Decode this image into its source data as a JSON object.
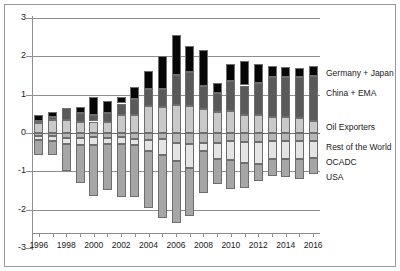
{
  "chart_data": {
    "type": "bar",
    "subtype": "stacked-bar-diverging",
    "title": "",
    "xlabel": "",
    "ylabel": "",
    "ylim": [
      -3,
      3
    ],
    "yticks": [
      3,
      2,
      1,
      0,
      -1,
      -2,
      -3
    ],
    "ytick_labels": [
      "3",
      "2",
      "1",
      "0",
      "-1",
      "-2",
      "-3"
    ],
    "grid": true,
    "legend_position": "right",
    "categories": [
      "1996",
      "1997",
      "1998",
      "1999",
      "2000",
      "2001",
      "2002",
      "2003",
      "2004",
      "2005",
      "2006",
      "2007",
      "2008",
      "2009",
      "2010",
      "2011",
      "2012",
      "2013",
      "2014",
      "2015",
      "2016"
    ],
    "xtick_labels": [
      "1996",
      "1998",
      "2000",
      "2002",
      "2004",
      "2006",
      "2008",
      "2010",
      "2012",
      "2014",
      "2016"
    ],
    "series": [
      {
        "name": "Germany + Japan",
        "color": "#c9c9c9",
        "values": [
          0.25,
          0.33,
          0.34,
          0.3,
          0.3,
          0.28,
          0.46,
          0.48,
          0.7,
          0.67,
          0.73,
          0.71,
          0.62,
          0.56,
          0.58,
          0.46,
          0.47,
          0.43,
          0.41,
          0.39,
          0.31
        ]
      },
      {
        "name": "China + EMA",
        "color": "#5a5a5a",
        "values": [
          0.07,
          0.09,
          0.31,
          0.22,
          0.17,
          0.23,
          0.31,
          0.42,
          0.45,
          0.47,
          0.78,
          0.88,
          0.62,
          0.49,
          0.77,
          0.78,
          0.83,
          1.03,
          1.06,
          1.07,
          1.19
        ]
      },
      {
        "name": "Oil Exporters",
        "color": "#060606",
        "values": [
          0.14,
          0.13,
          0.0,
          0.15,
          0.46,
          0.33,
          0.17,
          0.3,
          0.46,
          0.86,
          1.04,
          0.69,
          0.92,
          0.26,
          0.46,
          0.64,
          0.49,
          0.28,
          0.26,
          0.25,
          0.24
        ]
      },
      {
        "name": "Rest of the World",
        "color": "#b6b6b6",
        "values": [
          -0.08,
          -0.09,
          -0.12,
          -0.13,
          -0.11,
          -0.12,
          -0.1,
          -0.15,
          -0.19,
          -0.15,
          -0.27,
          -0.29,
          -0.27,
          -0.25,
          -0.22,
          -0.24,
          -0.23,
          -0.21,
          -0.22,
          -0.21,
          -0.2
        ]
      },
      {
        "name": "OCADC",
        "color": "#e4e4e4",
        "values": [
          -0.11,
          -0.13,
          -0.18,
          -0.19,
          -0.2,
          -0.18,
          -0.2,
          -0.17,
          -0.27,
          -0.42,
          -0.45,
          -0.62,
          -0.19,
          -0.42,
          -0.49,
          -0.54,
          -0.58,
          -0.47,
          -0.47,
          -0.46,
          -0.46
        ]
      },
      {
        "name": "USA",
        "color": "#a6a6a6",
        "values": [
          -0.39,
          -0.36,
          -0.7,
          -0.98,
          -1.33,
          -1.2,
          -1.37,
          -1.36,
          -1.49,
          -1.66,
          -1.62,
          -1.26,
          -1.1,
          -0.66,
          -0.74,
          -0.65,
          -0.44,
          -0.44,
          -0.45,
          -0.52,
          -0.4
        ]
      }
    ],
    "legend_entries": [
      {
        "label": "Germany + Japan",
        "color": "#c9c9c9"
      },
      {
        "label": "China + EMA",
        "color": "#5a5a5a"
      },
      {
        "label": "Oil Exporters",
        "color": "#060606"
      },
      {
        "label": "Rest of the World",
        "color": "#b6b6b6"
      },
      {
        "label": "OCADC",
        "color": "#e4e4e4"
      },
      {
        "label": "USA",
        "color": "#a6a6a6"
      }
    ]
  }
}
